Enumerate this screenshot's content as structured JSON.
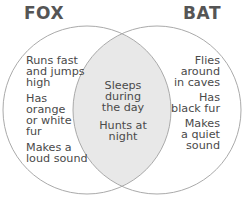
{
  "diagram": {
    "type": "venn",
    "colors": {
      "circle_stroke": "#aaaaaa",
      "intersection_fill": "#e8e8e8",
      "title_text": "#555555",
      "body_text": "#4a4a4a"
    },
    "left": {
      "title": "FOX",
      "items": [
        {
          "lines": [
            "Runs fast",
            "and jumps",
            "high"
          ]
        },
        {
          "lines": [
            "Has",
            "orange",
            "or white",
            "fur"
          ]
        },
        {
          "lines": [
            "Makes a",
            "loud sound"
          ]
        }
      ]
    },
    "right": {
      "title": "BAT",
      "items": [
        {
          "lines": [
            "Flies",
            "around",
            "in caves"
          ]
        },
        {
          "lines": [
            "Has",
            "black fur"
          ]
        },
        {
          "lines": [
            "Makes",
            "a quiet",
            "sound"
          ]
        }
      ]
    },
    "overlap": {
      "items": [
        {
          "lines": [
            "Sleeps",
            "during",
            "the day"
          ]
        },
        {
          "lines": [
            "Hunts at",
            "night"
          ]
        }
      ]
    }
  }
}
